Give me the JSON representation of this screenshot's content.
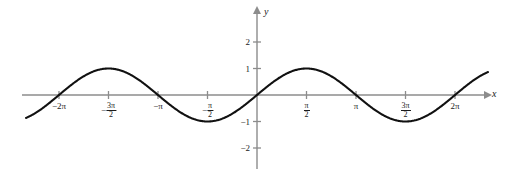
{
  "chart_data": {
    "type": "line",
    "title": "",
    "subtitle": "",
    "function": "y = sin(x)",
    "xlabel": "x",
    "ylabel": "y",
    "xlim": [
      -7.33,
      7.33
    ],
    "ylim": [
      -2.55,
      2.55
    ],
    "grid": false,
    "legend": null,
    "amplitude": 1,
    "period": 6.2832,
    "x_tick_labels": [
      {
        "value": -6.2832,
        "text": "−2π",
        "kind": "plain"
      },
      {
        "value": -4.7124,
        "text": "−3π/2",
        "kind": "fraction",
        "sign": "−",
        "num": "3π",
        "den": "2"
      },
      {
        "value": -3.1416,
        "text": "−π",
        "kind": "plain"
      },
      {
        "value": -1.5708,
        "text": "−π/2",
        "kind": "fraction",
        "sign": "−",
        "num": "π",
        "den": "2"
      },
      {
        "value": 1.5708,
        "text": "π/2",
        "kind": "fraction",
        "sign": "",
        "num": "π",
        "den": "2"
      },
      {
        "value": 3.1416,
        "text": "π",
        "kind": "plain"
      },
      {
        "value": 4.7124,
        "text": "3π/2",
        "kind": "fraction",
        "sign": "",
        "num": "3π",
        "den": "2"
      },
      {
        "value": 6.2832,
        "text": "2π",
        "kind": "plain"
      }
    ],
    "y_tick_labels": [
      {
        "value": 2,
        "text": "2"
      },
      {
        "value": 1,
        "text": "1"
      },
      {
        "value": -1,
        "text": "−1"
      },
      {
        "value": -2,
        "text": "−2"
      }
    ],
    "series": [
      {
        "name": "sin(x)",
        "color": "#111111",
        "x": [
          -6.95,
          -6.2832,
          -5.4978,
          -4.7124,
          -3.927,
          -3.1416,
          -2.3562,
          -1.5708,
          -0.7854,
          0,
          0.7854,
          1.5708,
          2.3562,
          3.1416,
          3.927,
          4.7124,
          5.4978,
          6.2832,
          6.95
        ],
        "values": [
          -0.64,
          0,
          1,
          0,
          -1,
          0,
          1,
          0,
          -1,
          0,
          1,
          0,
          -1,
          0,
          1,
          0,
          -1,
          0,
          0.64
        ]
      }
    ],
    "axis_color": "#8c8c8c",
    "curve_color": "#111111",
    "text_color": "#1a1a1a"
  },
  "axes": {
    "x_axis_label": "x",
    "y_axis_label": "y"
  }
}
